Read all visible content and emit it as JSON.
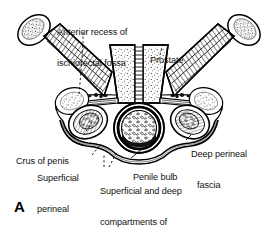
{
  "figure": {
    "letter": "A",
    "background_color": "#ffffff",
    "ink_color": "#000000"
  },
  "labels": [
    {
      "id": "anterior-recess",
      "text": "Anterior recess of\nischiorectal fossa",
      "line1": "Anterior recess of",
      "line2": "ischiorectal fossa",
      "x": 57,
      "y": 7,
      "align": "left",
      "leader": "dashed"
    },
    {
      "id": "prostate",
      "text": "Prostate",
      "line1": "Prostate",
      "x": 150,
      "y": 35,
      "align": "left",
      "leader": "dashed"
    },
    {
      "id": "crus-of-penis",
      "text": "Crus of penis",
      "line1": "Crus of penis",
      "x": 17,
      "y": 140,
      "align": "left",
      "leader": "dashed"
    },
    {
      "id": "superficial-perineal-fascia",
      "text": "Superficial\nperineal\nfascia",
      "line1": "Superficial",
      "line2": "perineal",
      "line3": "fascia",
      "x": 38,
      "y": 156,
      "align": "left",
      "leader": "dashed"
    },
    {
      "id": "deep-perineal-fascia",
      "text": "Deep perineal\nfascia",
      "line1": "Deep perineal",
      "line2": "fascia",
      "x": 192,
      "y": 131,
      "align": "left",
      "leader": "solid"
    },
    {
      "id": "penile-bulb",
      "text": "Penile bulb",
      "line1": "Penile bulb",
      "x": 133,
      "y": 154,
      "align": "left",
      "leader": "solid"
    },
    {
      "id": "superficial-deep-compartments",
      "text": "Superficial and deep\ncompartments of\nsuperficial perineal space",
      "line1": "Superficial and deep",
      "line2": "compartments of",
      "line3": "superficial perineal space",
      "x": 101,
      "y": 169,
      "align": "left",
      "leader": "dashed"
    }
  ],
  "structures": [
    {
      "id": "ischial-tuberosity-left",
      "name": "ischial tuberosity (left)",
      "texture": "stipple"
    },
    {
      "id": "ischial-tuberosity-right",
      "name": "ischial tuberosity (right)",
      "texture": "stipple"
    },
    {
      "id": "obturator-internus-left",
      "name": "obturator internus muscle (left)",
      "texture": "hatch"
    },
    {
      "id": "obturator-internus-right",
      "name": "obturator internus muscle (right)",
      "texture": "hatch"
    },
    {
      "id": "prostate-body",
      "name": "prostate",
      "texture": "stipple"
    },
    {
      "id": "prostatic-urethra",
      "name": "prostatic urethra",
      "texture": "striated"
    },
    {
      "id": "levator-ani-left",
      "name": "levator ani / perineal membrane (left)",
      "texture": "band"
    },
    {
      "id": "levator-ani-right",
      "name": "levator ani / perineal membrane (right)",
      "texture": "band"
    },
    {
      "id": "crus-left",
      "name": "crus of penis (left)",
      "texture": "stipple"
    },
    {
      "id": "crus-right",
      "name": "crus of penis (right)",
      "texture": "stipple"
    },
    {
      "id": "penile-bulb-body",
      "name": "bulb of penis",
      "texture": "mottled"
    },
    {
      "id": "fascia-superficial-arc",
      "name": "superficial perineal fascia (Colles)",
      "texture": "line"
    },
    {
      "id": "fascia-deep-arc",
      "name": "deep perineal fascia (Buck)",
      "texture": "line"
    },
    {
      "id": "fossa-left",
      "name": "anterior recess of ischiorectal fossa (left)",
      "texture": "stipple"
    },
    {
      "id": "fossa-right",
      "name": "anterior recess of ischiorectal fossa (right)",
      "texture": "stipple"
    }
  ]
}
